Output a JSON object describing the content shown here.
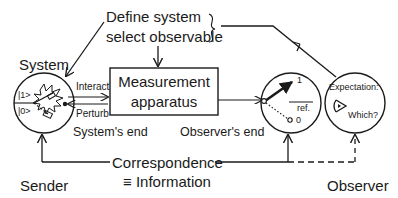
{
  "diagram": {
    "top_label": {
      "line1": "Define system",
      "line2": "select observable"
    },
    "system": {
      "title": "System",
      "state_one": "|1>",
      "state_zero": "|0>",
      "role": "Sender"
    },
    "links": {
      "interact": "Interact",
      "perturb": "Perturb",
      "system_end": "System's end",
      "observer_end": "Observer's end"
    },
    "apparatus": {
      "line1": "Measurement",
      "line2": "apparatus"
    },
    "meter": {
      "mark_one": "1",
      "mark_zero": "0",
      "ref": "ref."
    },
    "observer": {
      "expectation": "Expectation:",
      "which": "Which?",
      "role": "Observer"
    },
    "correspondence": {
      "line1": "Correspondence",
      "line2": "≡ Information"
    },
    "colors": {
      "stroke": "#1a1a1a",
      "background": "#ffffff"
    }
  }
}
